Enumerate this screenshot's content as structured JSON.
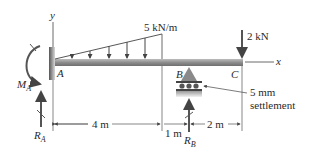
{
  "diagram": {
    "type": "beam-loading-diagram",
    "axes": {
      "y_label": "y",
      "x_label": "x"
    },
    "points": [
      {
        "id": "A",
        "label": "A"
      },
      {
        "id": "B",
        "label": "B"
      },
      {
        "id": "C",
        "label": "C"
      }
    ],
    "loads": {
      "distributed": {
        "label": "5 kN/m",
        "shape": "triangular",
        "arrow_count": 5
      },
      "point": {
        "label": "2 kN"
      }
    },
    "reactions": {
      "moment_A": {
        "symbol": "M",
        "subscript": "A"
      },
      "force_A": {
        "symbol": "R",
        "subscript": "A"
      },
      "force_B": {
        "symbol": "R",
        "subscript": "B"
      }
    },
    "settlement": {
      "line1": "5 mm",
      "line2": "settlement"
    },
    "dimensions": {
      "AB_load_span": "4 m",
      "to_B": "1 m",
      "BC": "2 m"
    },
    "colors": {
      "beam": "#8a8a8a",
      "arrow": "#555555",
      "line": "#333333",
      "support": "#777777"
    }
  }
}
